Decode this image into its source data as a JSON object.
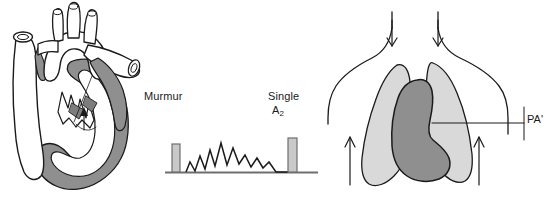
{
  "figure": {
    "width": 555,
    "height": 208,
    "background": "#ffffff"
  },
  "labels": {
    "murmur": "Murmur",
    "single": "Single",
    "a2_base": "A",
    "a2_sub": "2",
    "pa": "PA",
    "pa_suffix": "'"
  },
  "colors": {
    "stroke": "#1a1a1a",
    "chamber_shade": "#8f8f8f",
    "lung_shade": "#d9d9d9",
    "pa_shade": "#8f8f8f",
    "sound_bar_fill": "#c9c9c9",
    "sound_bar_stroke": "#6e6e6e",
    "baseline": "#6e6e6e",
    "text": "#1a1a1a",
    "background": "#ffffff"
  },
  "heart_panel": {
    "name": "heart-anatomy-diagram",
    "structures": [
      "descending aorta",
      "aortic arch",
      "brachiocephalic branches",
      "pulmonary artery",
      "left ventricle",
      "ventricular chamber blood pool",
      "mitral valve leaflets"
    ]
  },
  "phonocardiogram": {
    "name": "phonocardiogram",
    "baseline": {
      "x1": 165,
      "x2": 318,
      "y": 172
    },
    "s1_bar": {
      "label": "S1",
      "x": 172,
      "width": 8,
      "top": 144,
      "bottom": 172
    },
    "a2_bar": {
      "label": "A2",
      "x": 288,
      "width": 9,
      "top": 138,
      "bottom": 172
    },
    "murmur_shape": "diamond (crescendo-decrescendo) systolic murmur",
    "murmur_points": [
      [
        186,
        172
      ],
      [
        190,
        162
      ],
      [
        195,
        171
      ],
      [
        200,
        156
      ],
      [
        205,
        169
      ],
      [
        210,
        150
      ],
      [
        215,
        166
      ],
      [
        221,
        143
      ],
      [
        227,
        165
      ],
      [
        233,
        148
      ],
      [
        239,
        164
      ],
      [
        245,
        155
      ],
      [
        251,
        167
      ],
      [
        257,
        158
      ],
      [
        263,
        168
      ],
      [
        269,
        162
      ],
      [
        276,
        172
      ],
      [
        288,
        172
      ]
    ]
  },
  "chest_panel": {
    "name": "chest-silhouette-diagram",
    "structures": [
      "torso outline",
      "neck",
      "shoulders",
      "right lung",
      "left lung",
      "enlarged pulmonary artery and cardiac silhouette"
    ],
    "arrows": [
      {
        "name": "neck-arrow-left",
        "direction": "down"
      },
      {
        "name": "neck-arrow-right",
        "direction": "down"
      },
      {
        "name": "vascularity-arrow-left",
        "direction": "up"
      },
      {
        "name": "vascularity-arrow-right",
        "direction": "up"
      }
    ],
    "leader_line": {
      "x1": 432,
      "x2": 524,
      "y": 123
    }
  }
}
